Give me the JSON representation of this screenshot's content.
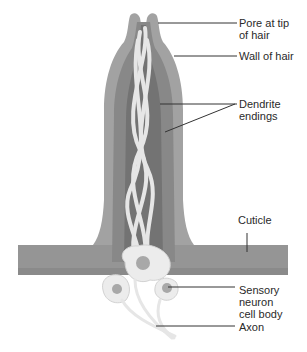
{
  "diagram": {
    "type": "anatomical-illustration",
    "labels": [
      {
        "id": "pore",
        "text": "Pore at tip\nof hair"
      },
      {
        "id": "wall",
        "text": "Wall of hair"
      },
      {
        "id": "dendrite",
        "text": "Dendrite\nendings"
      },
      {
        "id": "cuticle",
        "text": "Cuticle"
      },
      {
        "id": "sensory",
        "text": "Sensory\nneuron\ncell body"
      },
      {
        "id": "axon",
        "text": "Axon"
      }
    ],
    "colors": {
      "outer_wall": "#9a9a9a",
      "inner_wall": "#858585",
      "lumen": "#6f6f6f",
      "cuticle": "#959595",
      "dendrite": "#e4e4e4",
      "cell": "#ececec",
      "nucleus": "#a8a8a8",
      "leader": "#333333"
    }
  }
}
